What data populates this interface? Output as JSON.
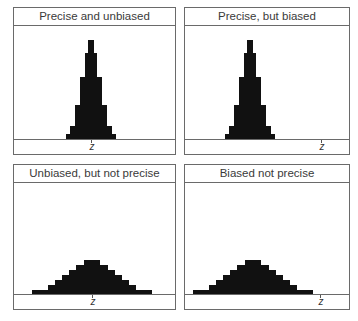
{
  "chart_data": [
    {
      "type": "bar",
      "title": "Precise and unbiased",
      "xlabel": "z",
      "true_value_position": "center",
      "distribution": "narrow, centered on z",
      "steps": [
        {
          "level": 1,
          "half_width": 25,
          "height": 5
        },
        {
          "level": 2,
          "half_width": 21,
          "height": 13
        },
        {
          "level": 3,
          "half_width": 16,
          "height": 34
        },
        {
          "level": 4,
          "half_width": 11,
          "height": 62
        },
        {
          "level": 5,
          "half_width": 6,
          "height": 86
        },
        {
          "level": 6,
          "half_width": 3,
          "height": 99
        }
      ]
    },
    {
      "type": "bar",
      "title": "Precise, but biased",
      "xlabel": "z",
      "true_value_position": "right",
      "distribution": "narrow, offset left of z",
      "steps": [
        {
          "level": 1,
          "half_width": 25,
          "height": 5
        },
        {
          "level": 2,
          "half_width": 21,
          "height": 13
        },
        {
          "level": 3,
          "half_width": 16,
          "height": 34
        },
        {
          "level": 4,
          "half_width": 11,
          "height": 62
        },
        {
          "level": 5,
          "half_width": 6,
          "height": 86
        },
        {
          "level": 6,
          "half_width": 3,
          "height": 99
        }
      ]
    },
    {
      "type": "bar",
      "title": "Unbiased, but not precise",
      "xlabel": "z",
      "true_value_position": "center",
      "distribution": "wide, centered on z",
      "steps": [
        {
          "level": 1,
          "half_width": 60,
          "height": 4
        },
        {
          "level": 2,
          "half_width": 44,
          "height": 9
        },
        {
          "level": 3,
          "half_width": 37,
          "height": 14
        },
        {
          "level": 4,
          "half_width": 30,
          "height": 19
        },
        {
          "level": 5,
          "half_width": 23,
          "height": 24
        },
        {
          "level": 6,
          "half_width": 16,
          "height": 29
        },
        {
          "level": 7,
          "half_width": 8,
          "height": 34
        }
      ]
    },
    {
      "type": "bar",
      "title": "Biased not precise",
      "xlabel": "z",
      "true_value_position": "right",
      "distribution": "wide, offset left of z",
      "steps": [
        {
          "level": 1,
          "half_width": 60,
          "height": 4
        },
        {
          "level": 2,
          "half_width": 44,
          "height": 9
        },
        {
          "level": 3,
          "half_width": 37,
          "height": 14
        },
        {
          "level": 4,
          "half_width": 30,
          "height": 19
        },
        {
          "level": 5,
          "half_width": 23,
          "height": 24
        },
        {
          "level": 6,
          "half_width": 16,
          "height": 29
        },
        {
          "level": 7,
          "half_width": 8,
          "height": 34
        }
      ]
    }
  ],
  "panels": [
    {
      "title": "Precise and unbiased",
      "axis_label": "z"
    },
    {
      "title": "Precise, but biased",
      "axis_label": "z"
    },
    {
      "title": "Unbiased, but not precise",
      "axis_label": "z"
    },
    {
      "title": "Biased not precise",
      "axis_label": "z"
    }
  ],
  "colors": {
    "bars": "#111111",
    "frame": "#6a6a6a",
    "text": "#3a3a3a"
  }
}
